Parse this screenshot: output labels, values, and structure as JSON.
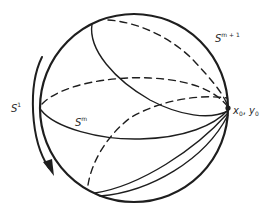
{
  "diagram": {
    "type": "sphere-with-great-circles",
    "colors": {
      "stroke": "#1e1e1e",
      "background": "#ffffff"
    },
    "labels": {
      "outer_sphere": {
        "base": "S",
        "sup": "m + 1"
      },
      "inner_sphere": {
        "base": "S",
        "sup": "m"
      },
      "circle_action": {
        "base": "S",
        "sup": "1"
      },
      "base_point": {
        "x": "x",
        "x_sub": "0",
        "sep": ", ",
        "y": "y",
        "y_sub": "0"
      }
    },
    "elements": [
      "outer sphere outline",
      "equator (front solid, back dashed)",
      "tilted great circle through base point (front solid, back dashed)",
      "lower great circle through base point (front solid, back dashed)",
      "curved arrow indicating S1 rotation",
      "marked base point x0, y0"
    ]
  }
}
